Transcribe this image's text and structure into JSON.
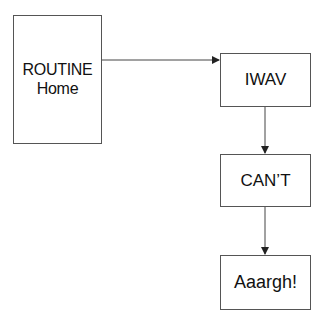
{
  "diagram": {
    "type": "flowchart",
    "nodes": [
      {
        "id": "routine",
        "lines": [
          "ROUTINE",
          "Home"
        ]
      },
      {
        "id": "iwav",
        "lines": [
          "IWAV"
        ]
      },
      {
        "id": "cant",
        "lines": [
          "CAN’T"
        ]
      },
      {
        "id": "aaargh",
        "lines": [
          "Aaargh!"
        ]
      }
    ],
    "edges": [
      {
        "from": "routine",
        "to": "iwav",
        "direction": "right"
      },
      {
        "from": "iwav",
        "to": "cant",
        "direction": "down"
      },
      {
        "from": "cant",
        "to": "aaargh",
        "direction": "down"
      }
    ],
    "colors": {
      "border": "#555555",
      "text": "#111111",
      "arrow": "#444444",
      "background": "#ffffff"
    }
  }
}
